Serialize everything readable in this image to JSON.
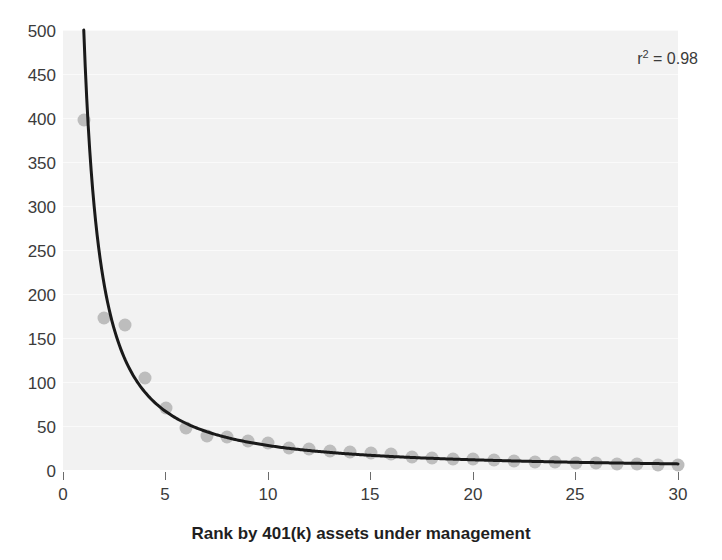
{
  "chart_data": {
    "type": "scatter",
    "title": "",
    "xlabel": "Rank by 401(k) assets under management",
    "ylabel": "",
    "xlim": [
      0,
      30
    ],
    "ylim": [
      0,
      500
    ],
    "xticks": [
      0,
      5,
      10,
      15,
      20,
      25,
      30
    ],
    "yticks": [
      0,
      50,
      100,
      150,
      200,
      250,
      300,
      350,
      400,
      450,
      500
    ],
    "grid": true,
    "legend": "none",
    "annotations": [
      {
        "text": "r2 = 0.98",
        "display": "r² = 0.98",
        "position": "top-right"
      }
    ],
    "series": [
      {
        "name": "Assets under management by rank",
        "kind": "scatter",
        "color": "#bdbdbd",
        "x": [
          1,
          2,
          3,
          4,
          5,
          6,
          7,
          8,
          9,
          10,
          11,
          12,
          13,
          14,
          15,
          16,
          17,
          18,
          19,
          20,
          21,
          22,
          23,
          24,
          25,
          26,
          27,
          28,
          29,
          30
        ],
        "y": [
          398,
          173,
          165,
          104,
          70,
          48,
          39,
          38,
          33,
          31,
          25,
          24,
          22,
          21,
          19,
          18,
          15,
          14,
          13,
          12,
          11,
          10,
          9,
          9,
          8,
          8,
          7,
          7,
          6,
          6
        ]
      },
      {
        "name": "Power-law fit",
        "kind": "line",
        "color": "#1a1a1a",
        "form": "power",
        "r_squared": 0.98
      }
    ]
  },
  "axis": {
    "y_tick_labels": [
      "500",
      "450",
      "400",
      "350",
      "300",
      "250",
      "200",
      "150",
      "100",
      "50",
      "0"
    ],
    "x_tick_labels": [
      "0",
      "5",
      "10",
      "15",
      "20",
      "25",
      "30"
    ]
  },
  "annotation": {
    "r2_prefix": "r",
    "r2_exponent": "2",
    "r2_value": "= 0.98"
  },
  "labels": {
    "x_axis_title": "Rank by 401(k) assets under management"
  },
  "colors": {
    "panel_background": "#f2f2f2",
    "gridline": "#fafafa",
    "point": "#bdbdbd",
    "curve": "#1a1a1a",
    "tick_text": "#3b3b3b",
    "axis_title_text": "#1f1f1f"
  }
}
